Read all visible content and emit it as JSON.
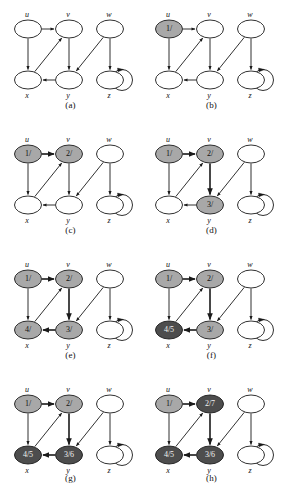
{
  "figure": {
    "colors": {
      "white": "#ffffff",
      "gray_discovered": "#a8a8a8",
      "gray_finished": "#4d4d4d",
      "stroke": "#1a1a1a",
      "text": "#111111",
      "text_on_dark": "#f2f2f2"
    },
    "node_names": {
      "u": "u",
      "v": "v",
      "w": "w",
      "x": "x",
      "y": "y",
      "z": "z"
    },
    "edges": [
      {
        "from": "u",
        "to": "v"
      },
      {
        "from": "u",
        "to": "x"
      },
      {
        "from": "x",
        "to": "v"
      },
      {
        "from": "v",
        "to": "y"
      },
      {
        "from": "y",
        "to": "x"
      },
      {
        "from": "w",
        "to": "y"
      },
      {
        "from": "w",
        "to": "z"
      },
      {
        "from": "z",
        "to": "z"
      }
    ],
    "panels": [
      {
        "id": "a",
        "caption": "(a)",
        "nodes": {
          "u": {
            "label": "",
            "state": "white"
          },
          "v": {
            "label": "",
            "state": "white"
          },
          "w": {
            "label": "",
            "state": "white"
          },
          "x": {
            "label": "",
            "state": "white"
          },
          "y": {
            "label": "",
            "state": "white"
          },
          "z": {
            "label": "",
            "state": "white"
          }
        },
        "tree_edges": []
      },
      {
        "id": "b",
        "caption": "(b)",
        "nodes": {
          "u": {
            "label": "1/",
            "state": "discovered"
          },
          "v": {
            "label": "",
            "state": "white"
          },
          "w": {
            "label": "",
            "state": "white"
          },
          "x": {
            "label": "",
            "state": "white"
          },
          "y": {
            "label": "",
            "state": "white"
          },
          "z": {
            "label": "",
            "state": "white"
          }
        },
        "tree_edges": []
      },
      {
        "id": "c",
        "caption": "(c)",
        "nodes": {
          "u": {
            "label": "1/",
            "state": "discovered"
          },
          "v": {
            "label": "2/",
            "state": "discovered"
          },
          "w": {
            "label": "",
            "state": "white"
          },
          "x": {
            "label": "",
            "state": "white"
          },
          "y": {
            "label": "",
            "state": "white"
          },
          "z": {
            "label": "",
            "state": "white"
          }
        },
        "tree_edges": [
          "u-v"
        ]
      },
      {
        "id": "d",
        "caption": "(d)",
        "nodes": {
          "u": {
            "label": "1/",
            "state": "discovered"
          },
          "v": {
            "label": "2/",
            "state": "discovered"
          },
          "w": {
            "label": "",
            "state": "white"
          },
          "x": {
            "label": "",
            "state": "white"
          },
          "y": {
            "label": "3/",
            "state": "discovered"
          },
          "z": {
            "label": "",
            "state": "white"
          }
        },
        "tree_edges": [
          "u-v",
          "v-y"
        ]
      },
      {
        "id": "e",
        "caption": "(e)",
        "nodes": {
          "u": {
            "label": "1/",
            "state": "discovered"
          },
          "v": {
            "label": "2/",
            "state": "discovered"
          },
          "w": {
            "label": "",
            "state": "white"
          },
          "x": {
            "label": "4/",
            "state": "discovered"
          },
          "y": {
            "label": "3/",
            "state": "discovered"
          },
          "z": {
            "label": "",
            "state": "white"
          }
        },
        "tree_edges": [
          "u-v",
          "v-y",
          "y-x"
        ]
      },
      {
        "id": "f",
        "caption": "(f)",
        "nodes": {
          "u": {
            "label": "1/",
            "state": "discovered"
          },
          "v": {
            "label": "2/",
            "state": "discovered"
          },
          "w": {
            "label": "",
            "state": "white"
          },
          "x": {
            "label": "4/5",
            "state": "finished"
          },
          "y": {
            "label": "3/",
            "state": "discovered"
          },
          "z": {
            "label": "",
            "state": "white"
          }
        },
        "tree_edges": [
          "u-v",
          "v-y",
          "y-x"
        ]
      },
      {
        "id": "g",
        "caption": "(g)",
        "nodes": {
          "u": {
            "label": "1/",
            "state": "discovered"
          },
          "v": {
            "label": "2/",
            "state": "discovered"
          },
          "w": {
            "label": "",
            "state": "white"
          },
          "x": {
            "label": "4/5",
            "state": "finished"
          },
          "y": {
            "label": "3/6",
            "state": "finished"
          },
          "z": {
            "label": "",
            "state": "white"
          }
        },
        "tree_edges": [
          "u-v",
          "v-y",
          "y-x"
        ]
      },
      {
        "id": "h",
        "caption": "(h)",
        "nodes": {
          "u": {
            "label": "1/",
            "state": "discovered"
          },
          "v": {
            "label": "2/7",
            "state": "finished"
          },
          "w": {
            "label": "",
            "state": "white"
          },
          "x": {
            "label": "4/5",
            "state": "finished"
          },
          "y": {
            "label": "3/6",
            "state": "finished"
          },
          "z": {
            "label": "",
            "state": "white"
          }
        },
        "tree_edges": [
          "u-v",
          "v-y",
          "y-x"
        ]
      }
    ]
  }
}
